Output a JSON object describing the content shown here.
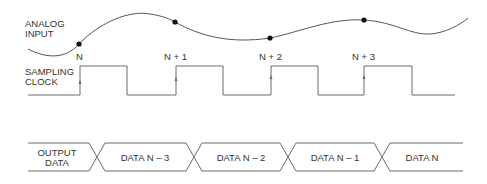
{
  "diagram": {
    "type": "timing-diagram",
    "signals": {
      "analog_input": {
        "label_line1": "ANALOG",
        "label_line2": "INPUT",
        "samples": [
          {
            "label": "N",
            "x": 79,
            "y": 44
          },
          {
            "label": "N + 1",
            "x": 175,
            "y": 22
          },
          {
            "label": "N + 2",
            "x": 270,
            "y": 38
          },
          {
            "label": "N + 3",
            "x": 364,
            "y": 20
          }
        ]
      },
      "sampling_clock": {
        "label_line1": "SAMPLING",
        "label_line2": "CLOCK",
        "rising_edges_x": [
          80,
          176,
          271,
          364
        ],
        "falling_edges_x": [
          127,
          223,
          318,
          412
        ]
      },
      "output_data": {
        "label_line1": "OUTPUT",
        "label_line2": "DATA",
        "segments": [
          {
            "label": "DATA N – 3"
          },
          {
            "label": "DATA N – 2"
          },
          {
            "label": "DATA N – 1"
          },
          {
            "label": "DATA N"
          }
        ]
      }
    },
    "colors": {
      "line": "#6a6a6a",
      "text": "#333333",
      "dot": "#111111"
    }
  }
}
